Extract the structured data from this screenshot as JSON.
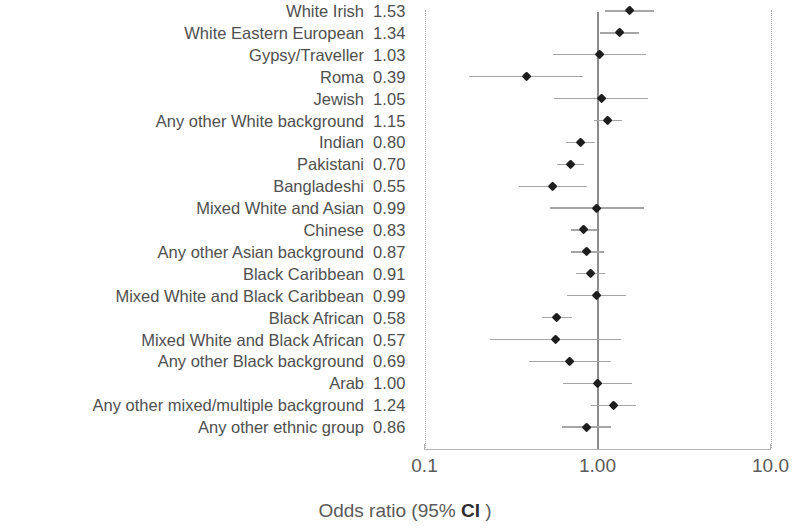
{
  "chart_data": {
    "type": "scatter",
    "subtype": "forest-plot",
    "title": "",
    "xlabel_prefix": "Odds ratio (95% ",
    "xlabel_emphasis": "CI",
    "xlabel_suffix": " )",
    "xlabel_full": "Odds ratio (95% CI )",
    "ylabel": "",
    "xscale": "log",
    "xlim": [
      0.1,
      10.0
    ],
    "xticks": [
      0.1,
      1.0,
      10.0
    ],
    "xticklabels": [
      "0.1",
      "1.00",
      "10.0"
    ],
    "reference_line": 1.0,
    "grid": false,
    "legend": "none",
    "value_column_header": "",
    "categories": [
      "White Irish",
      "White Eastern European",
      "Gypsy/Traveller",
      "Roma",
      "Jewish",
      "Any other White background",
      "Indian",
      "Pakistani",
      "Bangladeshi",
      "Mixed White and Asian",
      "Chinese",
      "Any other Asian background",
      "Black Caribbean",
      "Mixed White and Black Caribbean",
      "Black African",
      "Mixed White and Black African",
      "Any other Black background",
      "Arab",
      "Any other mixed/multiple background",
      "Any other ethnic group"
    ],
    "values": [
      1.53,
      1.34,
      1.03,
      0.39,
      1.05,
      1.15,
      0.8,
      0.7,
      0.55,
      0.99,
      0.83,
      0.87,
      0.91,
      0.99,
      0.58,
      0.57,
      0.69,
      1.0,
      1.24,
      0.86
    ],
    "value_labels": [
      "1.53",
      "1.34",
      "1.03",
      "0.39",
      "1.05",
      "1.15",
      "0.80",
      "0.70",
      "0.55",
      "0.99",
      "0.83",
      "0.87",
      "0.91",
      "0.99",
      "0.58",
      "0.57",
      "0.69",
      "1.00",
      "1.24",
      "0.86"
    ],
    "ci_low": [
      1.11,
      1.03,
      0.55,
      0.18,
      0.56,
      0.95,
      0.66,
      0.58,
      0.35,
      0.53,
      0.7,
      0.7,
      0.75,
      0.67,
      0.48,
      0.24,
      0.4,
      0.63,
      0.92,
      0.62
    ],
    "ci_high": [
      2.11,
      1.74,
      1.9,
      0.83,
      1.96,
      1.39,
      0.97,
      0.84,
      0.87,
      1.85,
      0.99,
      1.09,
      1.11,
      1.47,
      0.71,
      1.36,
      1.19,
      1.59,
      1.67,
      1.19
    ],
    "series_name": "Odds ratio",
    "marker": "diamond",
    "marker_color": "#1d1d1d",
    "ci_color": "#a5a5a5",
    "reference_line_color": "#8c8c8c",
    "boundary_line_color": "#a9a9a9"
  }
}
